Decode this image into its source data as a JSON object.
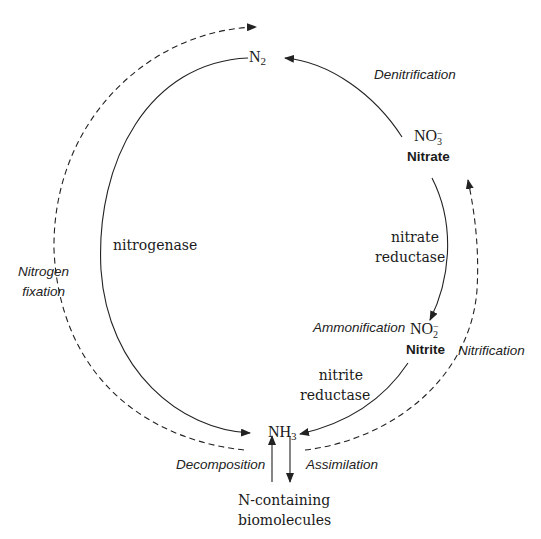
{
  "diagram": {
    "nodes": {
      "n2": {
        "formula": "N",
        "sub": "2"
      },
      "nitrate": {
        "formula": "NO",
        "sub": "3",
        "sup": "−",
        "name": "Nitrate"
      },
      "nitrite": {
        "formula": "NO",
        "sub": "2",
        "sup": "−",
        "name": "Nitrite"
      },
      "nh3": {
        "formula": "NH",
        "sub": "3"
      },
      "biomolecules": {
        "line1": "N-containing",
        "line2": "biomolecules"
      }
    },
    "enzymes": {
      "nitrogenase": "nitrogenase",
      "nitrate_reductase_1": "nitrate",
      "nitrate_reductase_2": "reductase",
      "nitrite_reductase_1": "nitrite",
      "nitrite_reductase_2": "reductase"
    },
    "processes": {
      "denitrification": "Denitrification",
      "nitrogen_fixation_1": "Nitrogen",
      "nitrogen_fixation_2": "fixation",
      "ammonification": "Ammonification",
      "nitrification": "Nitrification",
      "decomposition": "Decomposition",
      "assimilation": "Assimilation"
    },
    "colors": {
      "line": "#222222",
      "text": "#1a1a1a",
      "background": "#ffffff"
    }
  }
}
